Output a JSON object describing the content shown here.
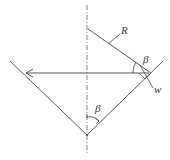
{
  "diagram": {
    "labels": {
      "R": "R",
      "beta_top": "β",
      "w": "w",
      "beta_bottom": "β"
    },
    "colors": {
      "line": "#444444",
      "axis": "#666666",
      "text": "#333333",
      "background": "#ffffff"
    }
  }
}
